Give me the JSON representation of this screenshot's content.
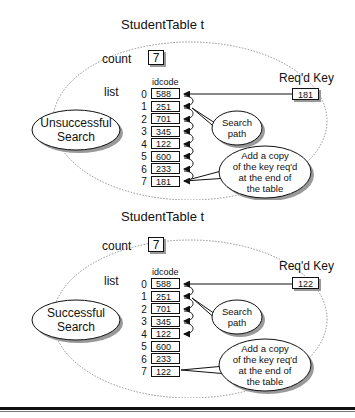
{
  "panels": [
    {
      "title": "StudentTable  t",
      "count_label": "count",
      "count_value": "7",
      "list_label": "list",
      "column_header": "idcode",
      "indices": [
        "0",
        "1",
        "2",
        "3",
        "4",
        "5",
        "6",
        "7"
      ],
      "idcodes": [
        "588",
        "251",
        "701",
        "345",
        "122",
        "600",
        "233",
        "181"
      ],
      "key_label": "Req'd Key",
      "key_value": "181",
      "search_type_line1": "Unsuccessful",
      "search_type_line2": "Search",
      "search_path_line1": "Search",
      "search_path_line2": "path",
      "add_copy_lines": [
        "Add a copy",
        "of the key req'd",
        "at the end of",
        "the table"
      ],
      "search_path_end_index": 7
    },
    {
      "title": "StudentTable  t",
      "count_label": "count",
      "count_value": "7",
      "list_label": "list",
      "column_header": "idcode",
      "indices": [
        "0",
        "1",
        "2",
        "3",
        "4",
        "5",
        "6",
        "7"
      ],
      "idcodes": [
        "588",
        "251",
        "701",
        "345",
        "122",
        "600",
        "233",
        "122"
      ],
      "key_label": "Req'd Key",
      "key_value": "122",
      "search_type_line1": "Successful",
      "search_type_line2": "Search",
      "search_path_line1": "Search",
      "search_path_line2": "path",
      "add_copy_lines": [
        "Add a copy",
        "of the key req'd",
        "at the end of",
        "the table"
      ],
      "search_path_end_index": 4
    }
  ]
}
